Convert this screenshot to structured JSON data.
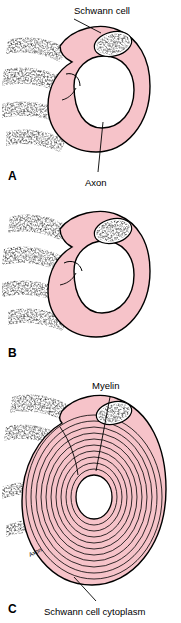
{
  "figure": {
    "colors": {
      "cytoplasm_pink": "#f6c3c9",
      "outline_black": "#000000",
      "background": "#ffffff",
      "nucleus_fill": "#ffffff"
    },
    "panels": [
      {
        "letter": "A",
        "labels": [
          {
            "name": "schwann-cell",
            "text": "Schwann cell"
          },
          {
            "name": "axon",
            "text": "Axon"
          }
        ]
      },
      {
        "letter": "B",
        "labels": []
      },
      {
        "letter": "C",
        "labels": [
          {
            "name": "myelin",
            "text": "Myelin"
          },
          {
            "name": "schwann-cell-cytoplasm",
            "text": "Schwann cell cytoplasm"
          },
          {
            "name": "axon-inner",
            "text": "Axon"
          }
        ]
      }
    ]
  }
}
